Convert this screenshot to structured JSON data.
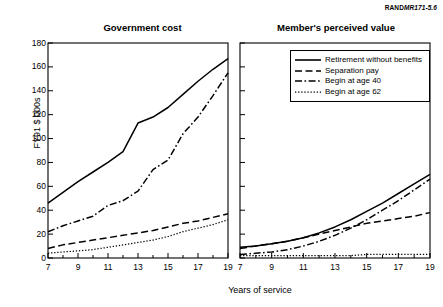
{
  "source_label": {
    "prefix": "RAND",
    "code": "MR171-5.6"
  },
  "axes": {
    "ylabel": "FY91 $ 000s",
    "xlabel": "Years of service",
    "yticks": [
      0,
      20,
      40,
      60,
      80,
      100,
      120,
      140,
      160,
      180
    ],
    "xticks": [
      7,
      9,
      11,
      13,
      15,
      17,
      19
    ],
    "ylim": [
      0,
      180
    ],
    "xlim": [
      7,
      19
    ]
  },
  "legend": {
    "position": "top-right of right panel",
    "items": [
      {
        "label": "Retirement without benefits",
        "style": "solid"
      },
      {
        "label": "Separation pay",
        "style": "dashed"
      },
      {
        "label": "Begin at age 40",
        "style": "dash-dot"
      },
      {
        "label": "Begin at age 62",
        "style": "dotted"
      }
    ]
  },
  "chart_data": [
    {
      "type": "line",
      "title": "Government cost",
      "xlabel": "Years of service",
      "ylabel": "FY91 $ 000s",
      "xlim": [
        7,
        19
      ],
      "ylim": [
        0,
        180
      ],
      "grid": false,
      "x": [
        7,
        8,
        9,
        10,
        11,
        12,
        13,
        14,
        15,
        16,
        17,
        18,
        19
      ],
      "series": [
        {
          "name": "Retirement without benefits",
          "style": "solid",
          "values": [
            46,
            55,
            64,
            72,
            80,
            89,
            113,
            118,
            126,
            137,
            148,
            158,
            167
          ]
        },
        {
          "name": "Separation pay",
          "style": "dashed",
          "values": [
            8,
            11,
            13,
            15,
            17,
            19,
            21,
            23,
            26,
            29,
            31,
            34,
            37
          ]
        },
        {
          "name": "Begin at age 40",
          "style": "dash-dot",
          "values": [
            22,
            27,
            31,
            35,
            44,
            48,
            56,
            74,
            82,
            104,
            118,
            136,
            155
          ]
        },
        {
          "name": "Begin at age 62",
          "style": "dotted",
          "values": [
            4,
            5,
            6,
            7,
            9,
            11,
            13,
            15,
            18,
            22,
            25,
            28,
            32
          ]
        }
      ]
    },
    {
      "type": "line",
      "title": "Member's perceived value",
      "xlabel": "Years of service",
      "ylabel": "FY91 $ 000s",
      "xlim": [
        7,
        19
      ],
      "ylim": [
        0,
        180
      ],
      "grid": false,
      "x": [
        7,
        8,
        9,
        10,
        11,
        12,
        13,
        14,
        15,
        16,
        17,
        18,
        19
      ],
      "series": [
        {
          "name": "Retirement without benefits",
          "style": "solid",
          "values": [
            9,
            10,
            12,
            14,
            17,
            21,
            26,
            32,
            39,
            46,
            54,
            62,
            70
          ]
        },
        {
          "name": "Separation pay",
          "style": "dashed",
          "values": [
            8,
            10,
            12,
            14,
            17,
            20,
            23,
            26,
            29,
            31,
            33,
            35,
            38
          ]
        },
        {
          "name": "Begin at age 40",
          "style": "dash-dot",
          "values": [
            3,
            4,
            5,
            7,
            10,
            14,
            19,
            25,
            32,
            40,
            48,
            57,
            66
          ]
        },
        {
          "name": "Begin at age 62",
          "style": "dotted",
          "values": [
            2,
            2,
            2,
            2,
            2,
            2,
            2,
            2,
            3,
            3,
            3,
            3,
            3
          ]
        }
      ]
    }
  ]
}
